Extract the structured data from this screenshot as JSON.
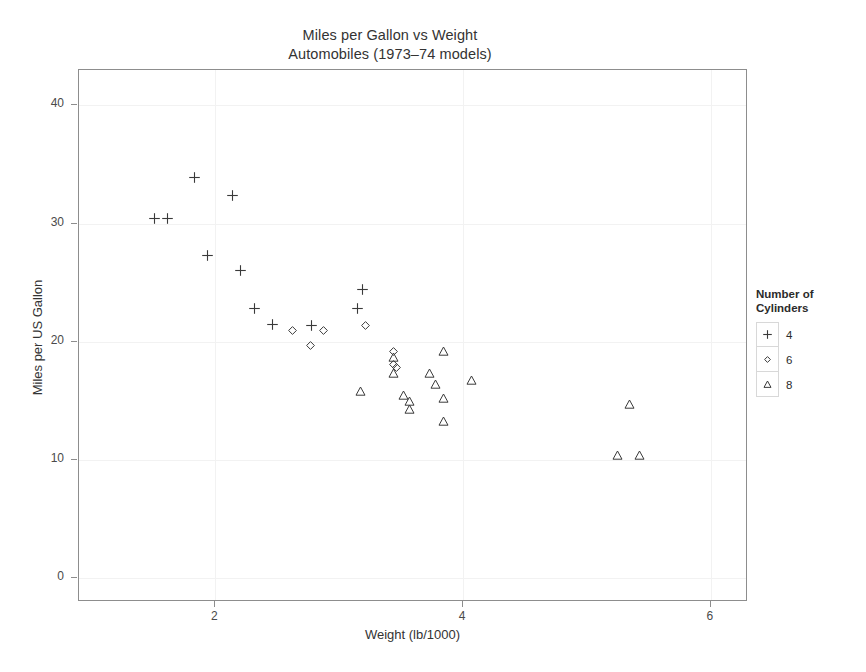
{
  "chart_data": {
    "type": "scatter",
    "title": "Miles per Gallon vs Weight",
    "subtitle": "Automobiles (1973–74 models)",
    "xlabel": "Weight (lb/1000)",
    "ylabel": "Miles per US Gallon",
    "xlim": [
      0.9,
      6.3
    ],
    "ylim": [
      -2.0,
      43.0
    ],
    "xticks": [
      2,
      4,
      6
    ],
    "xtick_labels": [
      "2",
      "4",
      "6"
    ],
    "yticks": [
      0,
      10,
      20,
      30,
      40
    ],
    "ytick_labels": [
      "0",
      "10",
      "20",
      "30",
      "40"
    ],
    "grid": true,
    "legend_position": "right",
    "legend": {
      "title_line1": "Number of",
      "title_line2": "Cylinders",
      "entries": [
        {
          "label": "4",
          "symbol": "plus"
        },
        {
          "label": "6",
          "symbol": "diamond"
        },
        {
          "label": "8",
          "symbol": "triangle"
        }
      ]
    },
    "series": [
      {
        "name": "4",
        "symbol": "plus",
        "points": [
          {
            "x": 1.513,
            "y": 30.4
          },
          {
            "x": 1.615,
            "y": 30.4
          },
          {
            "x": 1.835,
            "y": 33.9
          },
          {
            "x": 1.935,
            "y": 27.3
          },
          {
            "x": 2.14,
            "y": 32.4
          },
          {
            "x": 2.2,
            "y": 26.0
          },
          {
            "x": 2.32,
            "y": 22.8
          },
          {
            "x": 2.465,
            "y": 21.5
          },
          {
            "x": 2.78,
            "y": 21.4
          },
          {
            "x": 3.15,
            "y": 22.8
          },
          {
            "x": 3.19,
            "y": 24.4
          }
        ]
      },
      {
        "name": "6",
        "symbol": "diamond",
        "points": [
          {
            "x": 2.62,
            "y": 21.0
          },
          {
            "x": 2.77,
            "y": 19.7
          },
          {
            "x": 2.875,
            "y": 21.0
          },
          {
            "x": 3.215,
            "y": 21.4
          },
          {
            "x": 3.44,
            "y": 19.2
          },
          {
            "x": 3.44,
            "y": 18.1
          },
          {
            "x": 3.46,
            "y": 17.8
          }
        ]
      },
      {
        "name": "8",
        "symbol": "triangle",
        "points": [
          {
            "x": 3.17,
            "y": 15.8
          },
          {
            "x": 3.435,
            "y": 17.3
          },
          {
            "x": 3.44,
            "y": 18.7
          },
          {
            "x": 3.52,
            "y": 15.5
          },
          {
            "x": 3.57,
            "y": 14.3
          },
          {
            "x": 3.57,
            "y": 15.0
          },
          {
            "x": 3.73,
            "y": 17.3
          },
          {
            "x": 3.78,
            "y": 16.4
          },
          {
            "x": 3.84,
            "y": 15.2
          },
          {
            "x": 3.845,
            "y": 19.2
          },
          {
            "x": 3.845,
            "y": 13.3
          },
          {
            "x": 4.07,
            "y": 16.7
          },
          {
            "x": 5.25,
            "y": 10.4
          },
          {
            "x": 5.345,
            "y": 14.7
          },
          {
            "x": 5.424,
            "y": 10.4
          }
        ]
      }
    ]
  }
}
